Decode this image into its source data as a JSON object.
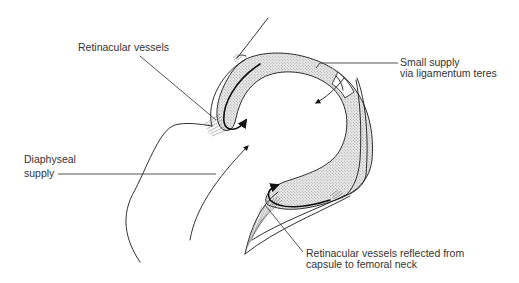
{
  "figure": {
    "colors": {
      "line": "#1a1a1a",
      "stipple_fill": "#d9d9d9",
      "text": "#333333",
      "background": "#ffffff"
    },
    "labels": {
      "retinacular_vessels": "Retinacular vessels",
      "small_supply_line1": "Small supply",
      "small_supply_line2": "via ligamentum teres",
      "diaphyseal_line1": "Diaphyseal",
      "diaphyseal_line2": "supply",
      "reflected_line1": "Retinacular vessels reflected from",
      "reflected_line2": "capsule to femoral neck"
    }
  }
}
